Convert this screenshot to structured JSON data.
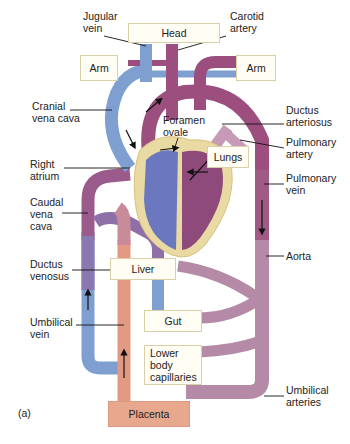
{
  "diagram": {
    "panel_label": "(a)",
    "colors": {
      "deoxygenated_blue": "#7f9fd0",
      "oxygenated_purple": "#9c4f7e",
      "mixed_pink": "#b9849f",
      "umbilical_vein_orange": "#e39a82",
      "heart_outline": "#e9d9a3",
      "box_fill": "#fffdf4",
      "placenta_fill": "#e8a88e"
    },
    "boxes": {
      "head": "Head",
      "arm_left": "Arm",
      "arm_right": "Arm",
      "lungs": "Lungs",
      "liver": "Liver",
      "gut": "Gut",
      "lower_body": "Lower\nbody\ncapillaries",
      "placenta": "Placenta"
    },
    "labels": {
      "jugular_vein": "Jugular\nvein",
      "carotid_artery": "Carotid\nartery",
      "cranial_vena_cava": "Cranial\nvena cava",
      "foramen_ovale": "Foramen\novale",
      "ductus_arteriosus": "Ductus\narteriosus",
      "pulmonary_artery": "Pulmonary\nartery",
      "right_atrium": "Right\natrium",
      "pulmonary_vein": "Pulmonary\nvein",
      "caudal_vena_cava": "Caudal\nvena\ncava",
      "aorta": "Aorta",
      "ductus_venosus": "Ductus\nvenosus",
      "umbilical_vein": "Umbilical\nvein",
      "umbilical_arteries": "Umbilical\narteries"
    }
  }
}
